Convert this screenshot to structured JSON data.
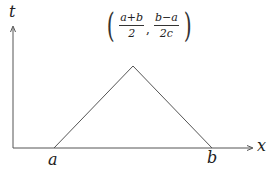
{
  "diagram": {
    "type": "triangular-function-plot",
    "axes": {
      "x_label": "x",
      "y_label": "t",
      "color": "#555555"
    },
    "points": {
      "start": {
        "label": "a",
        "px": [
          54,
          148
        ]
      },
      "end": {
        "label": "b",
        "px": [
          212,
          148
        ]
      },
      "peak": {
        "px": [
          133,
          66
        ]
      }
    },
    "peak_label": {
      "x_numerator": "a+b",
      "x_denominator": "2",
      "y_numerator": "b−a",
      "y_denominator": "2c",
      "separator": ",",
      "open_paren": "(",
      "close_paren": ")"
    },
    "line_color": "#555555"
  }
}
